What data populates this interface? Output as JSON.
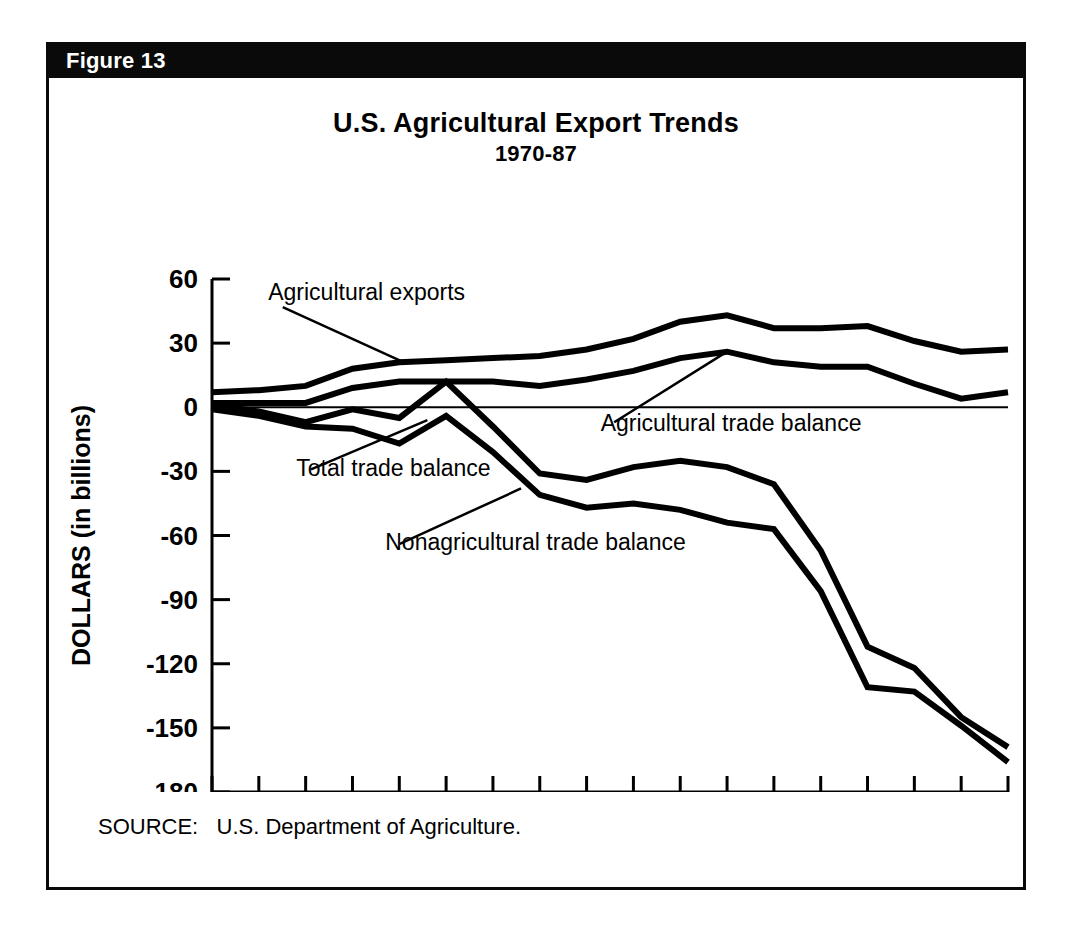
{
  "figure": {
    "label": "Figure 13",
    "banner_color": "#0a0a0a"
  },
  "title": "U.S. Agricultural Export Trends",
  "subtitle": "1970-87",
  "source_note": "SOURCE:   U.S. Department of Agriculture.",
  "chart_data": {
    "type": "line",
    "title": "U.S. Agricultural Export Trends",
    "subtitle": "1970-87",
    "xlabel": "",
    "ylabel": "DOLLARS (in billions)",
    "xlim": [
      1970,
      1987
    ],
    "ylim": [
      -180,
      60
    ],
    "yticks": [
      60,
      30,
      0,
      -30,
      -60,
      -90,
      -120,
      -150,
      -180
    ],
    "ytick_labels": [
      "60",
      "30",
      "0",
      "-30",
      "-60",
      "-90",
      "-120",
      "-150",
      "-180"
    ],
    "xticks": [
      1970,
      1971,
      1972,
      1973,
      1974,
      1975,
      1976,
      1977,
      1978,
      1979,
      1980,
      1981,
      1982,
      1983,
      1984,
      1985,
      1986,
      1987
    ],
    "xtick_labels_shown": [
      "1970",
      "1972",
      "1974",
      "1976",
      "1978",
      "1980",
      "1982",
      "1984",
      "1986",
      "1987"
    ],
    "grid": false,
    "legend": "inline-annotations",
    "zero_line": true,
    "x": [
      1970,
      1971,
      1972,
      1973,
      1974,
      1975,
      1976,
      1977,
      1978,
      1979,
      1980,
      1981,
      1982,
      1983,
      1984,
      1985,
      1986,
      1987
    ],
    "series": [
      {
        "name": "Agricultural exports",
        "values": [
          7,
          8,
          10,
          18,
          21,
          22,
          23,
          24,
          27,
          32,
          40,
          43,
          37,
          37,
          38,
          31,
          26,
          27
        ]
      },
      {
        "name": "Agricultural trade balance",
        "values": [
          2,
          2,
          2,
          9,
          12,
          12,
          12,
          10,
          13,
          17,
          23,
          26,
          21,
          19,
          19,
          11,
          4,
          7
        ]
      },
      {
        "name": "Total trade balance",
        "values": [
          1,
          -2,
          -7,
          -1,
          -5,
          12,
          -9,
          -31,
          -34,
          -28,
          -25,
          -28,
          -36,
          -67,
          -112,
          -122,
          -145,
          -159
        ]
      },
      {
        "name": "Nonagricultural trade balance",
        "values": [
          -1,
          -4,
          -9,
          -10,
          -17,
          -4,
          -21,
          -41,
          -47,
          -45,
          -48,
          -54,
          -57,
          -86,
          -131,
          -133,
          -149,
          -166
        ]
      }
    ],
    "annotations": [
      {
        "text": "Agricultural exports",
        "label_x": 1971.2,
        "label_y": 50,
        "point_x": 1974.1,
        "point_y": 21
      },
      {
        "text": "Agricultural trade balance",
        "label_x": 1978.3,
        "label_y": -11,
        "point_x": 1981.0,
        "point_y": 26
      },
      {
        "text": "Total trade balance",
        "label_x": 1971.8,
        "label_y": -32,
        "point_x": 1974.6,
        "point_y": -6
      },
      {
        "text": "Nonagricultural trade balance",
        "label_x": 1973.7,
        "label_y": -67,
        "point_x": 1976.6,
        "point_y": -38
      }
    ]
  },
  "axis": {
    "y_title": "DOLLARS (in billions)"
  }
}
